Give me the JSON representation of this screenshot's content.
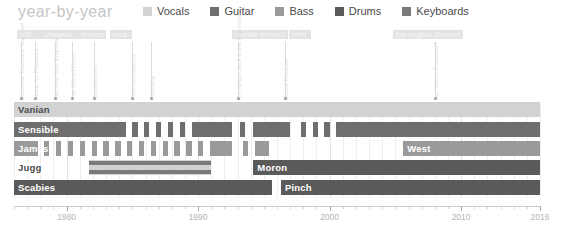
{
  "header": {
    "title": "year-by-year",
    "legend": [
      {
        "label": "Vocals",
        "color": "#d2d2d2"
      },
      {
        "label": "Guitar",
        "color": "#6e6e6e"
      },
      {
        "label": "Bass",
        "color": "#9a9a9a"
      },
      {
        "label": "Drums",
        "color": "#5a5a5a"
      },
      {
        "label": "Keyboards",
        "color": "#7a7a7a"
      }
    ]
  },
  "labels": {
    "tags": [
      {
        "text": "stiff",
        "year": 1976.2,
        "width": 26
      },
      {
        "text": "chiswick",
        "year": 1978.1,
        "width": 36
      },
      {
        "text": "bronze",
        "year": 1980.9,
        "width": 28
      },
      {
        "text": "mca",
        "year": 1983.3,
        "width": 22
      },
      {
        "text": "marble orchard",
        "year": 1992.6,
        "width": 56
      },
      {
        "text": "nitro",
        "year": 1996.9,
        "width": 22
      },
      {
        "text": "the english channel",
        "year": 2004.8,
        "width": 70
      }
    ],
    "songs": [
      {
        "text": "Damned, Damned, Damned",
        "year": 1976.5
      },
      {
        "text": "Music for Pleasure",
        "year": 1977.6
      },
      {
        "text": "Machine Gun Etiquette",
        "year": 1979.1
      },
      {
        "text": "The Black Album",
        "year": 1980.4
      },
      {
        "text": "Strawberries",
        "year": 1982.1
      },
      {
        "text": "Phantasmagoria",
        "year": 1985.0
      },
      {
        "text": "Anything",
        "year": 1986.4
      },
      {
        "text": "I'm Alright Jack & the Beanstalk",
        "year": 1993.0
      },
      {
        "text": "Grave Disorder",
        "year": 1996.6
      },
      {
        "text": "So, Who's Paranoid?",
        "year": 2008.0
      }
    ]
  },
  "chart_data": {
    "type": "bar",
    "title": "year-by-year",
    "xlabel": "",
    "ylabel": "",
    "xlim": [
      1976,
      2016
    ],
    "grid": true,
    "legend_position": "top",
    "tick_labels": [
      "1980",
      "1990",
      "2000",
      "2010",
      "2016"
    ],
    "tick_years": [
      1980,
      1990,
      2000,
      2010,
      2016
    ],
    "categories": [
      "Vanian",
      "Sensible",
      "James",
      "Jugg",
      "Scabies"
    ],
    "rows": [
      {
        "name": "Vanian",
        "label_dark": true,
        "segments": [
          {
            "start": 1976.0,
            "end": 2016.0,
            "role": "Vocals",
            "color": "#d2d2d2"
          }
        ]
      },
      {
        "name": "Sensible",
        "label_dark": false,
        "segments": [
          {
            "start": 1976.0,
            "end": 1984.5,
            "role": "Guitar",
            "color": "#6e6e6e"
          },
          {
            "start": 1985.0,
            "end": 1985.4,
            "role": "Guitar",
            "color": "#6e6e6e"
          },
          {
            "start": 1985.9,
            "end": 1986.3,
            "role": "Guitar",
            "color": "#6e6e6e"
          },
          {
            "start": 1986.8,
            "end": 1987.2,
            "role": "Guitar",
            "color": "#6e6e6e"
          },
          {
            "start": 1987.7,
            "end": 1988.1,
            "role": "Guitar",
            "color": "#6e6e6e"
          },
          {
            "start": 1988.6,
            "end": 1989.0,
            "role": "Guitar",
            "color": "#6e6e6e"
          },
          {
            "start": 1989.5,
            "end": 1992.6,
            "role": "Guitar",
            "color": "#6e6e6e"
          },
          {
            "start": 1993.2,
            "end": 1993.6,
            "role": "Guitar",
            "color": "#6e6e6e"
          },
          {
            "start": 1994.2,
            "end": 1997.0,
            "role": "Guitar",
            "color": "#6e6e6e"
          },
          {
            "start": 1997.8,
            "end": 1998.2,
            "role": "Guitar",
            "color": "#6e6e6e"
          },
          {
            "start": 1998.7,
            "end": 1999.1,
            "role": "Guitar",
            "color": "#6e6e6e"
          },
          {
            "start": 1999.6,
            "end": 2000.0,
            "role": "Guitar",
            "color": "#6e6e6e"
          },
          {
            "start": 2000.5,
            "end": 2016.0,
            "role": "Guitar",
            "color": "#6e6e6e"
          }
        ]
      },
      {
        "name": "James",
        "label_dark": false,
        "segments": [
          {
            "start": 1976.0,
            "end": 1977.8,
            "role": "Bass",
            "color": "#9a9a9a"
          },
          {
            "start": 1978.3,
            "end": 1978.7,
            "role": "Bass",
            "color": "#9a9a9a"
          },
          {
            "start": 1979.2,
            "end": 1979.6,
            "role": "Bass",
            "color": "#9a9a9a"
          },
          {
            "start": 1980.1,
            "end": 1980.5,
            "role": "Bass",
            "color": "#9a9a9a"
          },
          {
            "start": 1981.0,
            "end": 1981.4,
            "role": "Bass",
            "color": "#9a9a9a"
          },
          {
            "start": 1981.9,
            "end": 1982.3,
            "role": "Bass",
            "color": "#9a9a9a"
          },
          {
            "start": 1982.8,
            "end": 1983.2,
            "role": "Bass",
            "color": "#9a9a9a"
          },
          {
            "start": 1983.7,
            "end": 1984.1,
            "role": "Bass",
            "color": "#9a9a9a"
          },
          {
            "start": 1984.6,
            "end": 1985.0,
            "role": "Bass",
            "color": "#9a9a9a"
          },
          {
            "start": 1985.5,
            "end": 1985.9,
            "role": "Bass",
            "color": "#9a9a9a"
          },
          {
            "start": 1986.4,
            "end": 1986.8,
            "role": "Bass",
            "color": "#9a9a9a"
          },
          {
            "start": 1987.3,
            "end": 1987.7,
            "role": "Bass",
            "color": "#9a9a9a"
          },
          {
            "start": 1988.2,
            "end": 1988.6,
            "role": "Bass",
            "color": "#9a9a9a"
          },
          {
            "start": 1989.1,
            "end": 1989.5,
            "role": "Bass",
            "color": "#9a9a9a"
          },
          {
            "start": 1990.0,
            "end": 1990.4,
            "role": "Bass",
            "color": "#9a9a9a"
          },
          {
            "start": 1990.9,
            "end": 1992.6,
            "role": "Bass",
            "color": "#9a9a9a"
          },
          {
            "start": 1993.4,
            "end": 1993.8,
            "role": "Bass",
            "color": "#9a9a9a"
          },
          {
            "start": 1994.3,
            "end": 1995.4,
            "role": "Bass",
            "color": "#9a9a9a"
          },
          {
            "start": 2005.6,
            "end": 2016.0,
            "role": "Bass",
            "color": "#9a9a9a",
            "label": "West"
          }
        ]
      },
      {
        "name": "Jugg",
        "label_dark": true,
        "segments": [
          {
            "start": 1981.7,
            "end": 1991.0,
            "role": "Vocals",
            "color": "#d2d2d2"
          },
          {
            "start": 1981.7,
            "end": 1991.0,
            "role": "Keyboards",
            "color": "#7a7a7a",
            "inset_top": 1,
            "inset_height": 4
          },
          {
            "start": 1981.7,
            "end": 1991.0,
            "role": "Keyboards",
            "color": "#7a7a7a",
            "inset_top": 10,
            "inset_height": 4
          },
          {
            "start": 1994.2,
            "end": 2016.0,
            "role": "Drums",
            "color": "#5a5a5a",
            "label": "Moron"
          }
        ]
      },
      {
        "name": "Scabies",
        "label_dark": false,
        "segments": [
          {
            "start": 1976.0,
            "end": 1995.6,
            "role": "Drums",
            "color": "#5a5a5a"
          },
          {
            "start": 1996.3,
            "end": 2016.0,
            "role": "Drums",
            "color": "#5a5a5a",
            "label": "Pinch"
          }
        ]
      }
    ]
  }
}
